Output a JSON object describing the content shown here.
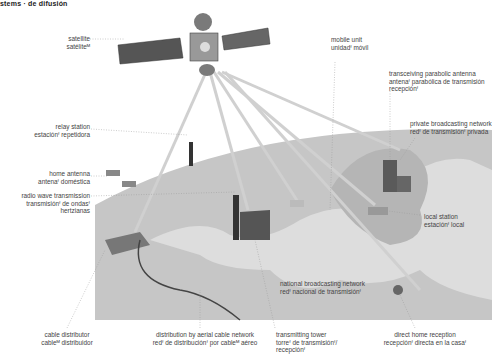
{
  "header": {
    "title": "stems · de difusión"
  },
  "labels": {
    "satellite": {
      "en": "satellite",
      "es": "satéliteᴹ"
    },
    "mobile_unit": {
      "en": "mobile unit",
      "es": "unidadᶠ móvil"
    },
    "transceiving_antenna": {
      "en": "transceiving parabolic antenna",
      "es": "antenaᶠ parabólica de transmisión",
      "es2": "recepciónᶠ"
    },
    "relay_station": {
      "en": "relay station",
      "es": "estaciónᶠ repetidora"
    },
    "private_network": {
      "en": "private broadcasting network",
      "es": "redᶠ de transmisiónᶠ privada"
    },
    "home_antenna": {
      "en": "home antenna",
      "es": "antenaᶠ doméstica"
    },
    "radio_wave": {
      "en": "radio wave transmission",
      "es": "transmisiónᶠ de ondasᶠ",
      "es2": "hertzianas"
    },
    "local_station": {
      "en": "local station",
      "es": "estaciónᶠ local"
    },
    "national_network": {
      "en": "national broadcasting network",
      "es": "redᶠ nacional de transmisiónᶠ"
    },
    "cable_distributor": {
      "en": "cable distributor",
      "es": "cableᴹ distribuidor"
    },
    "aerial_cable": {
      "en": "distribution by aerial cable network",
      "es": "redᶠ de distribuciónᶠ por cableᴹ aéreo"
    },
    "transmitting_tower": {
      "en": "transmitting tower",
      "es": "torreᶠ de transmisiónᶠ/",
      "es2": "recepciónᶠ"
    },
    "direct_home": {
      "en": "direct home reception",
      "es": "recepciónᶠ directa en la casaᶠ"
    }
  },
  "colors": {
    "ground": "#c9c9c9",
    "land_light": "#e0e0e0",
    "beam": "#d8d8d8",
    "building": "#6b6b6b"
  }
}
